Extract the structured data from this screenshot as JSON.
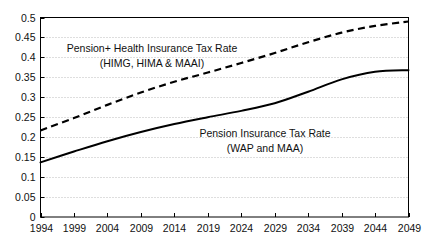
{
  "chart_data": {
    "type": "line",
    "title": "",
    "xlabel": "",
    "ylabel": "",
    "xlim": [
      1994,
      2049
    ],
    "ylim": [
      0,
      0.5
    ],
    "grid": true,
    "legend_position": "inline-annotations",
    "x_ticks": [
      "1994",
      "1999",
      "2004",
      "2009",
      "2014",
      "2019",
      "2024",
      "2029",
      "2034",
      "2039",
      "2044",
      "2049"
    ],
    "y_ticks": [
      "0",
      "0.05",
      "0.1",
      "0.15",
      "0.2",
      "0.25",
      "0.3",
      "0.35",
      "0.4",
      "0.45",
      "0.5"
    ],
    "x": [
      1994,
      1999,
      2004,
      2009,
      2014,
      2019,
      2024,
      2029,
      2034,
      2039,
      2044,
      2049
    ],
    "series": [
      {
        "name": "Pension+ Health Insurance Tax Rate (HIMG, HIMA & MAAI)",
        "style": "dashed",
        "color": "#000000",
        "values": [
          0.217,
          0.248,
          0.281,
          0.312,
          0.339,
          0.362,
          0.386,
          0.411,
          0.438,
          0.462,
          0.479,
          0.49
        ]
      },
      {
        "name": "Pension Insurance Tax Rate (WAP and MAA)",
        "style": "solid",
        "color": "#000000",
        "values": [
          0.137,
          0.164,
          0.19,
          0.213,
          0.233,
          0.25,
          0.266,
          0.285,
          0.314,
          0.345,
          0.364,
          0.368
        ]
      }
    ],
    "annotations": [
      {
        "id": "upper",
        "line1": "Pension+ Health Insurance Tax Rate",
        "line2": "(HIMG, HIMA & MAAI)"
      },
      {
        "id": "lower",
        "line1": "Pension Insurance Tax Rate",
        "line2": "(WAP and MAA)"
      }
    ]
  },
  "colors": {
    "axis": "#000000",
    "grid": "#bdbdbd",
    "background": "#ffffff",
    "text": "#111111"
  }
}
